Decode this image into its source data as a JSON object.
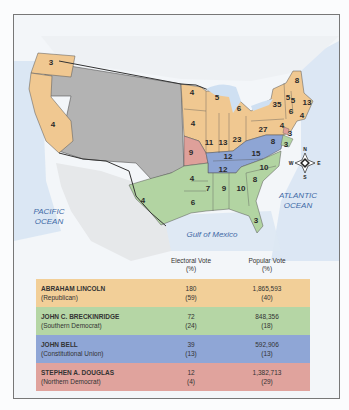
{
  "colors": {
    "republican": "#f2cf98",
    "southern_democrat": "#b5d6a5",
    "constitutional_union": "#8fa6d6",
    "northern_democrat": "#e0a39d",
    "territory": "#b7b7b7",
    "ocean": "#dbe7f3"
  },
  "map": {
    "ocean_labels": {
      "pacific_line1": "PACIFIC",
      "pacific_line2": "OCEAN",
      "atlantic_line1": "ATLANTIC",
      "atlantic_line2": "OCEAN",
      "gulf": "Gulf of Mexico"
    },
    "compass": {
      "n": "N",
      "s": "S",
      "e": "E",
      "w": "W"
    },
    "state_votes": [
      {
        "id": "oregon",
        "v": "3",
        "x": 50,
        "y": 61
      },
      {
        "id": "california",
        "v": "4",
        "x": 52,
        "y": 123
      },
      {
        "id": "minnesota",
        "v": "4",
        "x": 191,
        "y": 91
      },
      {
        "id": "wisconsin",
        "v": "5",
        "x": 216,
        "y": 96
      },
      {
        "id": "michigan",
        "v": "6",
        "x": 238,
        "y": 107
      },
      {
        "id": "iowa",
        "v": "4",
        "x": 192,
        "y": 122
      },
      {
        "id": "illinois",
        "v": "11",
        "x": 208,
        "y": 141
      },
      {
        "id": "indiana",
        "v": "13",
        "x": 222,
        "y": 141
      },
      {
        "id": "ohio",
        "v": "23",
        "x": 236,
        "y": 138
      },
      {
        "id": "pennsylvania",
        "v": "27",
        "x": 262,
        "y": 128
      },
      {
        "id": "new-york",
        "v": "35",
        "x": 276,
        "y": 103
      },
      {
        "id": "vermont",
        "v": "5",
        "x": 287,
        "y": 96
      },
      {
        "id": "new-hampshire",
        "v": "5",
        "x": 292,
        "y": 99
      },
      {
        "id": "maine",
        "v": "8",
        "x": 296,
        "y": 79
      },
      {
        "id": "massachusetts",
        "v": "13",
        "x": 306,
        "y": 101
      },
      {
        "id": "connecticut",
        "v": "6",
        "x": 290,
        "y": 110
      },
      {
        "id": "rhode-island",
        "v": "4",
        "x": 301,
        "y": 114
      },
      {
        "id": "new-jersey",
        "v": "4",
        "x": 281,
        "y": 124
      },
      {
        "id": "delaware",
        "v": "3",
        "x": 289,
        "y": 132
      },
      {
        "id": "maryland",
        "v": "8",
        "x": 272,
        "y": 140
      },
      {
        "id": "md-3",
        "v": "3",
        "x": 285,
        "y": 143
      },
      {
        "id": "missouri",
        "v": "9",
        "x": 190,
        "y": 151
      },
      {
        "id": "kentucky",
        "v": "12",
        "x": 227,
        "y": 155
      },
      {
        "id": "virginia",
        "v": "15",
        "x": 255,
        "y": 152
      },
      {
        "id": "tennessee",
        "v": "12",
        "x": 222,
        "y": 168
      },
      {
        "id": "north-carolina",
        "v": "10",
        "x": 263,
        "y": 166
      },
      {
        "id": "south-carolina",
        "v": "8",
        "x": 254,
        "y": 178
      },
      {
        "id": "arkansas",
        "v": "4",
        "x": 191,
        "y": 177
      },
      {
        "id": "texas",
        "v": "4",
        "x": 142,
        "y": 199
      },
      {
        "id": "louisiana",
        "v": "6",
        "x": 192,
        "y": 201
      },
      {
        "id": "mississippi",
        "v": "7",
        "x": 207,
        "y": 187
      },
      {
        "id": "alabama",
        "v": "9",
        "x": 223,
        "y": 187
      },
      {
        "id": "georgia",
        "v": "10",
        "x": 240,
        "y": 187
      },
      {
        "id": "florida",
        "v": "3",
        "x": 255,
        "y": 219
      }
    ]
  },
  "legend": {
    "header": {
      "ev_line1": "Electoral Vote",
      "ev_line2": "(%)",
      "pv_line1": "Popular Vote",
      "pv_line2": "(%)"
    },
    "rows": [
      {
        "candidate": "ABRAHAM LINCOLN",
        "party": "(Republican)",
        "ev": "180",
        "ev_pct": "(59)",
        "pv": "1,865,593",
        "pv_pct": "(40)",
        "color": "#f2cf98"
      },
      {
        "candidate": "JOHN C. BRECKINRIDGE",
        "party": "(Southern Democrat)",
        "ev": "72",
        "ev_pct": "(24)",
        "pv": "848,356",
        "pv_pct": "(18)",
        "color": "#b5d6a5"
      },
      {
        "candidate": "JOHN BELL",
        "party": "(Constitutional Union)",
        "ev": "39",
        "ev_pct": "(13)",
        "pv": "592,906",
        "pv_pct": "(13)",
        "color": "#8fa6d6"
      },
      {
        "candidate": "STEPHEN A. DOUGLAS",
        "party": "(Northern Democrat)",
        "ev": "12",
        "ev_pct": "(4)",
        "pv": "1,382,713",
        "pv_pct": "(29)",
        "color": "#e0a39d"
      }
    ]
  }
}
